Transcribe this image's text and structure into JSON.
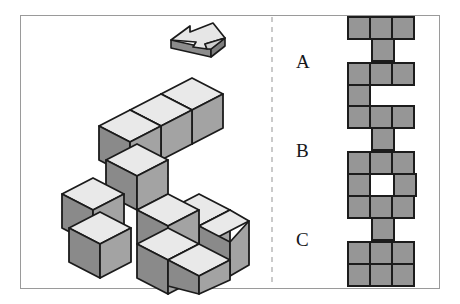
{
  "figure": {
    "title_visible": false,
    "frame": {
      "border_color": "#9a9a9a"
    },
    "divider": {
      "name": "dashed-divider",
      "color": "#b9b9b9",
      "style": "dashed",
      "x": 272
    },
    "colors": {
      "cube_top": "#e9e9e9",
      "cube_left": "#8a8a8a",
      "cube_right": "#a3a3a3",
      "cube_outline": "#1b1b1b",
      "grid_cell": "#969696",
      "grid_outline": "#1c1c1c",
      "arrow_top": "#e6e6e6",
      "arrow_front": "#8c8c8c",
      "arrow_outline": "#1b1b1b",
      "frame_border": "#9a9a9a",
      "background": "#ffffff",
      "label_text": "#15161a"
    },
    "arrow": {
      "name": "rotation-direction-arrow",
      "direction": "left",
      "style": "3d-block-arrow"
    },
    "solid": {
      "name": "isometric-cube-assembly",
      "description": "3D assembly of unit cubes drawn in isometric projection",
      "cube_count": 11
    }
  },
  "options": [
    {
      "id": "A",
      "label": "A",
      "grid": [
        [
          1,
          1,
          1
        ],
        [
          0,
          1,
          0
        ],
        [
          1,
          1,
          1
        ],
        [
          1,
          0,
          0
        ]
      ]
    },
    {
      "id": "B",
      "label": "B",
      "grid": [
        [
          1,
          1,
          1
        ],
        [
          0,
          1,
          0
        ],
        [
          1,
          1,
          1
        ],
        [
          1,
          0,
          1
        ]
      ]
    },
    {
      "id": "C",
      "label": "C",
      "grid": [
        [
          1,
          1,
          1
        ],
        [
          0,
          1,
          0
        ],
        [
          1,
          1,
          1
        ],
        [
          1,
          1,
          1
        ]
      ]
    }
  ]
}
